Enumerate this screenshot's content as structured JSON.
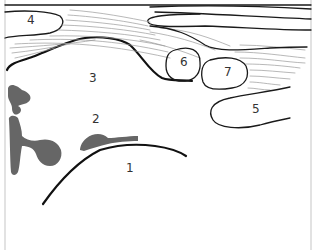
{
  "diagram": {
    "labels": [
      {
        "id": "1",
        "text": "1",
        "x": 126,
        "y": 172
      },
      {
        "id": "2",
        "text": "2",
        "x": 92,
        "y": 123
      },
      {
        "id": "3",
        "text": "3",
        "x": 89,
        "y": 82
      },
      {
        "id": "4",
        "text": "4",
        "x": 27,
        "y": 24
      },
      {
        "id": "5",
        "text": "5",
        "x": 252,
        "y": 113
      },
      {
        "id": "6",
        "text": "6",
        "x": 180,
        "y": 66
      },
      {
        "id": "7",
        "text": "7",
        "x": 224,
        "y": 76
      }
    ],
    "colors": {
      "outline": "#1a1a1a",
      "fibre": "#9a9a9a",
      "mass": "#666666",
      "frame": "#d8d8d8",
      "background": "#ffffff"
    }
  }
}
